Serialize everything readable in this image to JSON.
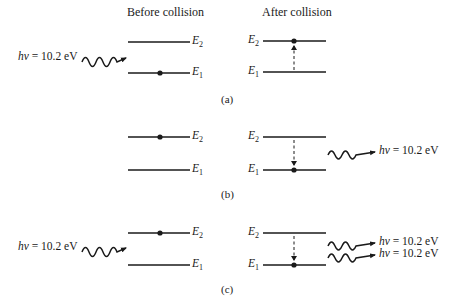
{
  "headings": {
    "before": "Before collision",
    "after": "After collision"
  },
  "levels": {
    "e2": {
      "symbol": "E",
      "sub": "2"
    },
    "e1": {
      "symbol": "E",
      "sub": "1"
    }
  },
  "photon": {
    "h": "h",
    "nu": "ν",
    "rest": " = 10.2 eV"
  },
  "panels": [
    {
      "caption": "(a)",
      "description": "Absorption: incoming photon hν = 10.2 eV excites electron from E1 to E2",
      "before": {
        "electron_level": "E1",
        "incoming_photons": 1
      },
      "after": {
        "electron_level": "E2",
        "transition": "up",
        "outgoing_photons": 0
      }
    },
    {
      "caption": "(b)",
      "description": "Spontaneous emission: electron drops from E2 to E1, emitting hν = 10.2 eV",
      "before": {
        "electron_level": "E2",
        "incoming_photons": 0
      },
      "after": {
        "electron_level": "E1",
        "transition": "down",
        "outgoing_photons": 1
      }
    },
    {
      "caption": "(c)",
      "description": "Stimulated emission: incoming photon triggers drop from E2 to E1, two photons hν = 10.2 eV leave",
      "before": {
        "electron_level": "E2",
        "incoming_photons": 1
      },
      "after": {
        "electron_level": "E1",
        "transition": "down",
        "outgoing_photons": 2
      }
    }
  ],
  "colors": {
    "ink": "#1a1a1a",
    "background": "#ffffff"
  }
}
